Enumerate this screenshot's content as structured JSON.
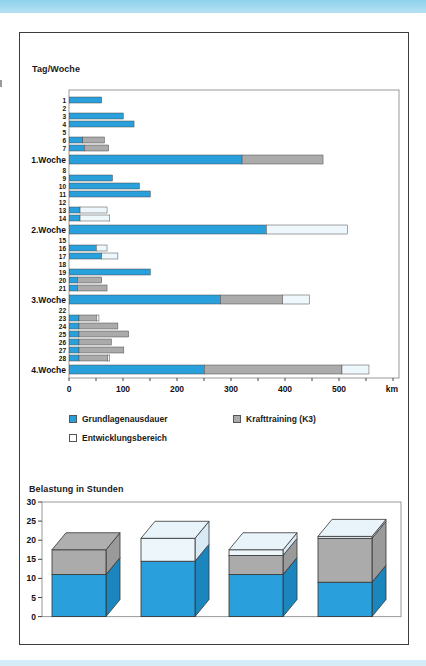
{
  "page": {
    "top_band_color": "#8ed1ea",
    "bottom_band_color": "#d5edf7",
    "figure_border_color": "#3c3c3c"
  },
  "legend": {
    "items": [
      {
        "label": "Grundlagenausdauer",
        "color": "#29A0DB"
      },
      {
        "label": "Krafttraining (K3)",
        "color": "#ABABAB"
      },
      {
        "label": "Entwicklungsbereich",
        "color": "#FFFFFF"
      }
    ]
  },
  "chart_data": [
    {
      "type": "bar",
      "orientation": "horizontal",
      "title": "Tag/Woche",
      "xlabel": "km",
      "xlim": [
        0,
        610
      ],
      "x_major_ticks": [
        0,
        100,
        200,
        300,
        400,
        500
      ],
      "x_minor_tick_step": 50,
      "grid": false,
      "series_names": [
        "Grundlagenausdauer",
        "Krafttraining (K3)",
        "Entwicklungsbereich"
      ],
      "colors": {
        "blue": "#29A0DB",
        "gray": "#ABABAB",
        "white": "#EEF7FC"
      },
      "rows": [
        {
          "label": "1",
          "type": "day",
          "blue": 60,
          "gray": 0,
          "white": 0
        },
        {
          "label": "2",
          "type": "day",
          "blue": 0,
          "gray": 0,
          "white": 0
        },
        {
          "label": "3",
          "type": "day",
          "blue": 100,
          "gray": 0,
          "white": 0
        },
        {
          "label": "4",
          "type": "day",
          "blue": 120,
          "gray": 0,
          "white": 0
        },
        {
          "label": "5",
          "type": "day",
          "blue": 0,
          "gray": 0,
          "white": 0
        },
        {
          "label": "6",
          "type": "day",
          "blue": 25,
          "gray": 40,
          "white": 0
        },
        {
          "label": "7",
          "type": "day",
          "blue": 28,
          "gray": 45,
          "white": 0
        },
        {
          "label": "1.Woche",
          "type": "week",
          "blue": 320,
          "gray": 150,
          "white": 0
        },
        {
          "label": "8",
          "type": "day",
          "blue": 0,
          "gray": 0,
          "white": 0
        },
        {
          "label": "9",
          "type": "day",
          "blue": 80,
          "gray": 0,
          "white": 0
        },
        {
          "label": "10",
          "type": "day",
          "blue": 130,
          "gray": 0,
          "white": 0
        },
        {
          "label": "11",
          "type": "day",
          "blue": 150,
          "gray": 0,
          "white": 0
        },
        {
          "label": "12",
          "type": "day",
          "blue": 0,
          "gray": 0,
          "white": 0
        },
        {
          "label": "13",
          "type": "day",
          "blue": 20,
          "gray": 0,
          "white": 50
        },
        {
          "label": "14",
          "type": "day",
          "blue": 20,
          "gray": 0,
          "white": 55
        },
        {
          "label": "2.Woche",
          "type": "week",
          "blue": 365,
          "gray": 0,
          "white": 150
        },
        {
          "label": "15",
          "type": "day",
          "blue": 0,
          "gray": 0,
          "white": 0
        },
        {
          "label": "16",
          "type": "day",
          "blue": 50,
          "gray": 0,
          "white": 20
        },
        {
          "label": "17",
          "type": "day",
          "blue": 60,
          "gray": 0,
          "white": 30
        },
        {
          "label": "18",
          "type": "day",
          "blue": 0,
          "gray": 0,
          "white": 0
        },
        {
          "label": "19",
          "type": "day",
          "blue": 150,
          "gray": 0,
          "white": 0
        },
        {
          "label": "20",
          "type": "day",
          "blue": 15,
          "gray": 45,
          "white": 0
        },
        {
          "label": "21",
          "type": "day",
          "blue": 15,
          "gray": 55,
          "white": 0
        },
        {
          "label": "3.Woche",
          "type": "week",
          "blue": 280,
          "gray": 115,
          "white": 50
        },
        {
          "label": "22",
          "type": "day",
          "blue": 0,
          "gray": 0,
          "white": 0
        },
        {
          "label": "23",
          "type": "day",
          "blue": 18,
          "gray": 32,
          "white": 5
        },
        {
          "label": "24",
          "type": "day",
          "blue": 18,
          "gray": 72,
          "white": 0
        },
        {
          "label": "25",
          "type": "day",
          "blue": 18,
          "gray": 92,
          "white": 0
        },
        {
          "label": "26",
          "type": "day",
          "blue": 18,
          "gray": 60,
          "white": 0
        },
        {
          "label": "27",
          "type": "day",
          "blue": 18,
          "gray": 83,
          "white": 0
        },
        {
          "label": "28",
          "type": "day",
          "blue": 18,
          "gray": 53,
          "white": 4
        },
        {
          "label": "4.Woche",
          "type": "week",
          "blue": 250,
          "gray": 255,
          "white": 50
        }
      ]
    },
    {
      "type": "bar",
      "style": "3d-stacked-column",
      "title": "Belastung in Stunden",
      "ylabel": "",
      "ylim": [
        0,
        30
      ],
      "yticks": [
        0,
        5,
        10,
        15,
        20,
        25,
        30
      ],
      "grid": false,
      "categories": [
        "1.Woche",
        "2.Woche",
        "3.Woche",
        "4.Woche"
      ],
      "series": [
        {
          "name": "Grundlagenausdauer",
          "key": "blue",
          "values": [
            11,
            14.5,
            11,
            9
          ]
        },
        {
          "name": "Krafttraining (K3)",
          "key": "gray",
          "values": [
            6.5,
            0,
            5,
            11.5
          ]
        },
        {
          "name": "Entwicklungsbereich",
          "key": "white",
          "values": [
            0,
            6,
            1.5,
            0.5
          ]
        }
      ]
    }
  ]
}
